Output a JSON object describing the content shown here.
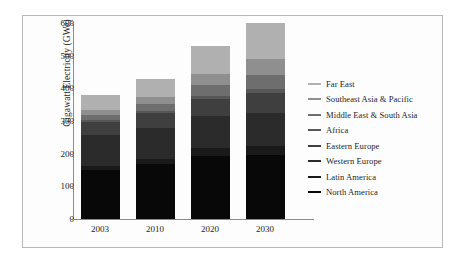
{
  "chart_data": {
    "type": "bar",
    "stacked": true,
    "title": "",
    "xlabel": "",
    "ylabel": "Gigawatt Electricity (GWe)",
    "categories": [
      "2003",
      "2010",
      "2020",
      "2030"
    ],
    "ylim": [
      0,
      600
    ],
    "yticks": [
      0,
      100,
      200,
      300,
      400,
      500,
      600
    ],
    "grid": false,
    "legend_position": "right",
    "series": [
      {
        "name": "Far East",
        "color": "#b0b0b0",
        "values": [
          45,
          55,
          85,
          110
        ]
      },
      {
        "name": "Southeast Asia & Pacific",
        "color": "#8f8f8f",
        "values": [
          18,
          22,
          35,
          48
        ]
      },
      {
        "name": "Middle East & South Asia",
        "color": "#6e6e6e",
        "values": [
          14,
          20,
          32,
          44
        ]
      },
      {
        "name": "Africa",
        "color": "#575757",
        "values": [
          6,
          7,
          10,
          13
        ]
      },
      {
        "name": "Eastern Europe",
        "color": "#3f3f3f",
        "values": [
          40,
          44,
          52,
          60
        ]
      },
      {
        "name": "Western Europe",
        "color": "#2b2b2b",
        "values": [
          95,
          97,
          100,
          100
        ]
      },
      {
        "name": "Latin America",
        "color": "#1a1a1a",
        "values": [
          12,
          15,
          22,
          30
        ]
      },
      {
        "name": "North America",
        "color": "#080808",
        "values": [
          150,
          168,
          194,
          195
        ]
      }
    ],
    "totals": [
      380,
      428,
      530,
      600
    ]
  },
  "legend": {
    "items": [
      {
        "label": "Far East"
      },
      {
        "label": "Southeast Asia & Pacific"
      },
      {
        "label": "Middle East & South Asia"
      },
      {
        "label": "Africa"
      },
      {
        "label": "Eastern Europe"
      },
      {
        "label": "Western Europe"
      },
      {
        "label": "Latin America"
      },
      {
        "label": "North America"
      }
    ]
  }
}
